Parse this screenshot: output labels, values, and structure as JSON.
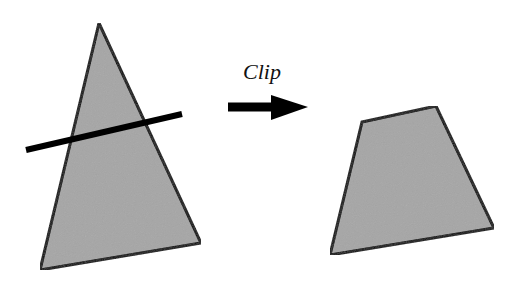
{
  "diagram": {
    "colors": {
      "background": "#ffffff",
      "fill": "#a6a6a6",
      "stroke": "#000000"
    },
    "input_triangle": {
      "points": [
        [
          99,
          23
        ],
        [
          201,
          243
        ],
        [
          40,
          270
        ]
      ],
      "stroke_width": 3
    },
    "clip_line": {
      "x1": 26,
      "y1": 150,
      "x2": 182,
      "y2": 114,
      "stroke_width": 6
    },
    "arrow": {
      "label": "Clip",
      "label_x": 262,
      "label_y": 79,
      "shaft": {
        "x1": 228,
        "y1": 107,
        "x2": 273,
        "y2": 107,
        "width": 9
      },
      "head": [
        [
          271,
          95
        ],
        [
          308,
          107
        ],
        [
          271,
          120
        ]
      ]
    },
    "output_polygon": {
      "points": [
        [
          362,
          122
        ],
        [
          436,
          106
        ],
        [
          494,
          228
        ],
        [
          330,
          255
        ]
      ],
      "stroke_width": 3
    }
  }
}
